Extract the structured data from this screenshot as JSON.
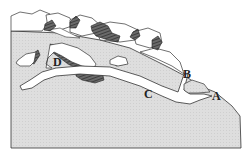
{
  "diagram": {
    "type": "geological-cross-section",
    "labels": {
      "A": "A",
      "B": "B",
      "C": "C",
      "D": "D"
    },
    "colors": {
      "ground": "#dcdcdc",
      "outline": "#333333",
      "boulder_fill": "#ffffff",
      "boulder_shadow": "#555555",
      "passage": "#ffffff"
    }
  }
}
